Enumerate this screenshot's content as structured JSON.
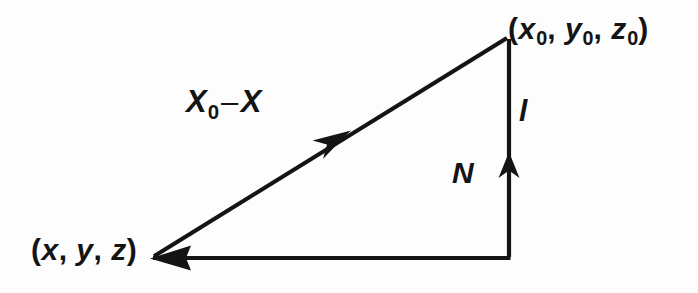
{
  "figure": {
    "name": "vector-triangle-diagram",
    "background_color": "#fdfdfd",
    "stroke_color": "#141414",
    "labels": {
      "point0": {
        "open_paren": "(",
        "x_symbol": "x",
        "x_sub": "0",
        "comma1": ", ",
        "y_symbol": "y",
        "y_sub": "0",
        "comma2": ", ",
        "z_symbol": "z",
        "z_sub": "0",
        "close_paren": ")",
        "plain": "(x0, y0, z0)"
      },
      "point": {
        "open_paren": "(",
        "x_symbol": "x",
        "comma1": ", ",
        "y_symbol": "y",
        "comma2": ", ",
        "z_symbol": "z",
        "close_paren": ")",
        "plain": "(x, y, z)"
      },
      "vector": {
        "x0_symbol": "X",
        "x0_sub": "0",
        "operator": "–",
        "x_symbol": "X",
        "plain": "X0 – X"
      },
      "length": {
        "symbol": "l",
        "plain": "l"
      },
      "normal": {
        "symbol": "N",
        "plain": "N"
      }
    },
    "geometry": {
      "apex": "(507, 37)",
      "left_vertex": "(152, 258)",
      "right_vertex": "(509, 258)",
      "hypotenuse_arrow_tip": "(348, 133)",
      "normal_arrow_tip": "(509, 155)",
      "left_arrow_tip": "(152, 258)"
    }
  }
}
